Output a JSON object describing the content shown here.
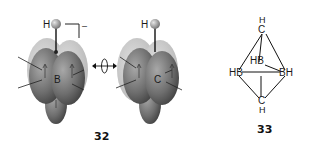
{
  "figure": {
    "compound_32": {
      "label": "32",
      "left_structure": {
        "atom_top": "H",
        "center_atom": "B",
        "charge_bracket": "–"
      },
      "right_structure": {
        "atom_top": "H",
        "center_atom": "C"
      },
      "relation_symbol": "isolobal-arrow"
    },
    "compound_33": {
      "label": "33",
      "atoms": {
        "top_c": "C",
        "top_h": "H",
        "left": "HB",
        "back": "HB",
        "right": "BH",
        "bottom_c": "C",
        "bottom_h": "H"
      }
    },
    "colors": {
      "orbital_dark": "#5a5a5a",
      "orbital_mid": "#8a8a8a",
      "orbital_light": "#c8c8c8",
      "hydrogen": "#a0a0a0",
      "line": "#111111"
    }
  }
}
